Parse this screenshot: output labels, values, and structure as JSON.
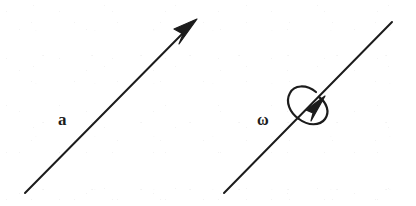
{
  "figure": {
    "background_color": "#ffffff",
    "ink_color": "#1c1c1c",
    "width": 416,
    "height": 206,
    "panels": [
      {
        "id": "left",
        "label": "a",
        "label_meaning": "acceleration vector",
        "label_position": {
          "x": 58,
          "y": 111
        },
        "line": {
          "x1": 25,
          "y1": 193,
          "x2": 196,
          "y2": 20
        },
        "has_arrowhead": true,
        "arrow_direction": "up-right",
        "has_rotation_loop": false
      },
      {
        "id": "right",
        "label": "ω",
        "label_meaning": "angular velocity vector axis",
        "label_position": {
          "x": 257,
          "y": 112
        },
        "line": {
          "x1": 224,
          "y1": 193,
          "x2": 392,
          "y2": 22
        },
        "has_arrowhead": false,
        "arrow_direction": "none",
        "has_rotation_loop": true,
        "rotation_loop": {
          "center": {
            "x": 309,
            "y": 106
          },
          "radius_x": 21,
          "radius_y": 12,
          "tilt_degrees": -45,
          "sense": "counterclockwise",
          "arrowhead_at": {
            "x": 320,
            "y": 101
          },
          "arrowhead_direction": "up-right"
        }
      }
    ]
  },
  "strokes": {
    "line_width": 2.0,
    "loop_line_width": 2.2,
    "color": "#1c1c1c"
  },
  "labels": {
    "a": "a",
    "omega": "ω"
  }
}
